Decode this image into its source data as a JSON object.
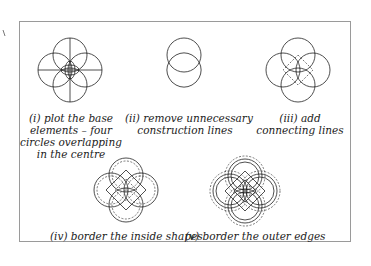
{
  "figure": {
    "steps": [
      {
        "id": "i",
        "caption_lines": [
          "(i) plot the base",
          "elements – four",
          "circles overlapping",
          "in the centre"
        ]
      },
      {
        "id": "ii",
        "caption_lines": [
          "(ii) remove unnecessary",
          "construction lines"
        ]
      },
      {
        "id": "iii",
        "caption_lines": [
          "(iii) add",
          "connecting lines"
        ]
      },
      {
        "id": "iv",
        "caption_lines": [
          "(iv) border the inside shapes"
        ]
      },
      {
        "id": "v",
        "caption_lines": [
          "(v) border the outer edges"
        ]
      }
    ],
    "colors": {
      "line": "#222222",
      "frame": "#9a9a9a",
      "dashed": "#555555"
    }
  }
}
